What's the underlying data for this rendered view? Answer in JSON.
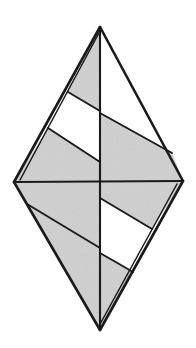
{
  "figure": {
    "name": "twisted-bipyramid-diagram",
    "title": "Twisted bipyramid / skew antiprism line drawing",
    "background_color": "#ffffff",
    "shade_color": "#d2d2d2",
    "blank_color": "#ffffff",
    "stroke_color": "#1a1a1a",
    "outer_stroke_width": 2.6,
    "inner_stroke_width": 1.9,
    "canvas": {
      "width": 196,
      "height": 348
    }
  },
  "vertices": {
    "apex": {
      "label": "apex",
      "x": 100,
      "y": 27
    },
    "left": {
      "label": "left",
      "x": 14,
      "y": 182
    },
    "right": {
      "label": "right",
      "x": 183,
      "y": 181
    },
    "bottom": {
      "label": "bottom",
      "x": 100,
      "y": 330
    },
    "center": {
      "label": "center",
      "x": 100,
      "y": 181
    },
    "ul_chord_a_start": {
      "label": "upper-left chord A start",
      "x": 68,
      "y": 92
    },
    "ul_chord_a_end": {
      "label": "upper-left chord A end",
      "x": 100,
      "y": 111
    },
    "ul_chord_b_start": {
      "label": "upper-left chord B start",
      "x": 48,
      "y": 128
    },
    "ul_chord_b_end": {
      "label": "upper-left chord B end",
      "x": 100,
      "y": 162
    },
    "ur_chord_start": {
      "label": "upper-right chord start",
      "x": 100,
      "y": 113
    },
    "ur_chord_end": {
      "label": "upper-right chord end",
      "x": 172,
      "y": 153
    },
    "ll_chord_start": {
      "label": "lower-left chord start",
      "x": 27,
      "y": 204
    },
    "ll_chord_end": {
      "label": "lower-left chord end",
      "x": 100,
      "y": 248
    },
    "lr_chord_a_start": {
      "label": "lower-right chord A start",
      "x": 100,
      "y": 198
    },
    "lr_chord_a_end": {
      "label": "lower-right chord A end",
      "x": 152,
      "y": 229
    },
    "lr_chord_b_start": {
      "label": "lower-right chord B start",
      "x": 100,
      "y": 253
    },
    "lr_chord_b_end": {
      "label": "lower-right chord B end",
      "x": 133,
      "y": 272
    }
  },
  "faces": [
    {
      "id": "upper-left-top",
      "shading": "shaded",
      "points": "100,27 68,92 100,111"
    },
    {
      "id": "upper-left-blank",
      "shading": "blank",
      "points": "68,92 48,128 100,162 100,111"
    },
    {
      "id": "upper-left-lower",
      "shading": "shaded",
      "points": "48,128 14,182 100,182 100,162"
    },
    {
      "id": "upper-right-top",
      "shading": "shaded",
      "points": "100,27 100,113 172,153 183,181 100,181"
    },
    {
      "id": "lower-left-upper",
      "shading": "shaded",
      "points": "100,182 14,182 27,204 100,248"
    },
    {
      "id": "lower-left-lower",
      "shading": "shaded",
      "points": "27,204 100,330 100,248"
    },
    {
      "id": "lower-right-upper",
      "shading": "shaded",
      "points": "100,181 183,181 152,229 100,198"
    },
    {
      "id": "lower-right-blank",
      "shading": "blank",
      "points": "100,198 152,229 133,272 100,253"
    },
    {
      "id": "lower-right-lower",
      "shading": "shaded",
      "points": "100,253 133,272 100,330"
    }
  ],
  "edges": {
    "outer": [
      {
        "id": "apex-to-left",
        "d": "M100,27 L14,182"
      },
      {
        "id": "apex-to-right",
        "d": "M100,27 L183,181"
      },
      {
        "id": "left-to-bottom",
        "d": "M14,182 L100,330"
      },
      {
        "id": "right-to-bottom",
        "d": "M183,181 L100,330"
      }
    ],
    "doubled": [
      {
        "id": "apex-to-left-inner-rail",
        "d": "M100,30 L19,181"
      },
      {
        "id": "right-to-bottom-inner-rail",
        "d": "M178,183 L99,327"
      }
    ],
    "axis": [
      {
        "id": "vertical-axis",
        "d": "M100,27 L100,330"
      },
      {
        "id": "horizontal-axis",
        "d": "M14,182 L183,181"
      }
    ],
    "inner": [
      {
        "id": "upper-left-chord-a",
        "d": "M68,92 L100,111"
      },
      {
        "id": "upper-left-chord-b",
        "d": "M48,128 L100,162"
      },
      {
        "id": "upper-right-chord",
        "d": "M100,113 L172,153"
      },
      {
        "id": "lower-left-chord",
        "d": "M27,204 L100,248"
      },
      {
        "id": "lower-right-chord-a",
        "d": "M100,198 L152,229"
      },
      {
        "id": "lower-right-chord-b",
        "d": "M100,253 L133,272"
      }
    ]
  }
}
